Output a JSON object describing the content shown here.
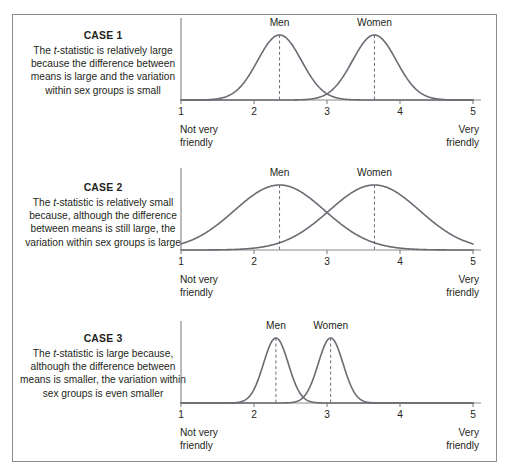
{
  "figure": {
    "border_color": "#8c8c8c",
    "background_color": "#ffffff",
    "text_color": "#231f20",
    "curve_color": "#6b6b73",
    "axis_color": "#8c8c8c"
  },
  "cases": [
    {
      "title": "CASE 1",
      "description_before_t": "The ",
      "description_t": "t",
      "description_after_t": "-statistic is relatively large because the difference between means is large and the variation within sex groups is small",
      "men_label": "Men",
      "women_label": "Women",
      "axis_left_label_line1": "Not very",
      "axis_left_label_line2": "friendly",
      "axis_right_label_line1": "Very",
      "axis_right_label_line2": "friendly"
    },
    {
      "title": "CASE 2",
      "description_before_t": "The ",
      "description_t": "t",
      "description_after_t": "-statistic is relatively small because, although the difference between means is still large, the variation within sex groups is large",
      "men_label": "Men",
      "women_label": "Women",
      "axis_left_label_line1": "Not very",
      "axis_left_label_line2": "friendly",
      "axis_right_label_line1": "Very",
      "axis_right_label_line2": "friendly"
    },
    {
      "title": "CASE 3",
      "description_before_t": "The ",
      "description_t": "t",
      "description_after_t": "-statistic is large because, although the difference between means is smaller, the variation within sex groups is even smaller",
      "men_label": "Men",
      "women_label": "Women",
      "axis_left_label_line1": "Not very",
      "axis_left_label_line2": "friendly",
      "axis_right_label_line1": "Very",
      "axis_right_label_line2": "friendly"
    }
  ],
  "chart_data": [
    {
      "type": "line",
      "title": "CASE 1",
      "xlabel": "",
      "ylabel": "",
      "xlim": [
        1,
        5
      ],
      "ticks": [
        1,
        2,
        3,
        4,
        5
      ],
      "tick_labels": [
        "1",
        "2",
        "3",
        "4",
        "5"
      ],
      "grid": false,
      "legend_position": "above-curves",
      "axis_anchor_low": "Not very friendly",
      "axis_anchor_high": "Very friendly",
      "series": [
        {
          "name": "Men",
          "distribution": "normal",
          "mean": 2.35,
          "sd": 0.3,
          "peak_height": 1.0,
          "mean_line": "dashed"
        },
        {
          "name": "Women",
          "distribution": "normal",
          "mean": 3.65,
          "sd": 0.3,
          "peak_height": 1.0,
          "mean_line": "dashed"
        }
      ]
    },
    {
      "type": "line",
      "title": "CASE 2",
      "xlabel": "",
      "ylabel": "",
      "xlim": [
        1,
        5
      ],
      "ticks": [
        1,
        2,
        3,
        4,
        5
      ],
      "tick_labels": [
        "1",
        "2",
        "3",
        "4",
        "5"
      ],
      "grid": false,
      "legend_position": "above-curves",
      "axis_anchor_low": "Not very friendly",
      "axis_anchor_high": "Very friendly",
      "series": [
        {
          "name": "Men",
          "distribution": "normal",
          "mean": 2.35,
          "sd": 0.62,
          "peak_height": 1.0,
          "mean_line": "dashed"
        },
        {
          "name": "Women",
          "distribution": "normal",
          "mean": 3.65,
          "sd": 0.62,
          "peak_height": 1.0,
          "mean_line": "dashed"
        }
      ]
    },
    {
      "type": "line",
      "title": "CASE 3",
      "xlabel": "",
      "ylabel": "",
      "xlim": [
        1,
        5
      ],
      "ticks": [
        1,
        2,
        3,
        4,
        5
      ],
      "tick_labels": [
        "1",
        "2",
        "3",
        "4",
        "5"
      ],
      "grid": false,
      "legend_position": "above-curves",
      "axis_anchor_low": "Not very friendly",
      "axis_anchor_high": "Very friendly",
      "series": [
        {
          "name": "Men",
          "distribution": "normal",
          "mean": 2.3,
          "sd": 0.17,
          "peak_height": 1.0,
          "mean_line": "dashed"
        },
        {
          "name": "Women",
          "distribution": "normal",
          "mean": 3.05,
          "sd": 0.17,
          "peak_height": 1.0,
          "mean_line": "dashed"
        }
      ]
    }
  ]
}
